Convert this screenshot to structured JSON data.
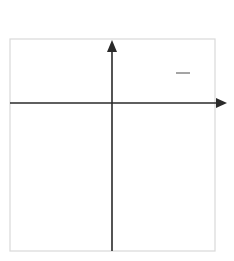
{
  "chart_data": {
    "type": "line",
    "title": "",
    "function": "f(x) = -1/3 x^2",
    "xlabel": "x",
    "ylabel": "y",
    "xlim": [
      -5,
      5
    ],
    "ylim": [
      -7,
      3
    ],
    "grid": true,
    "grid_step": 1,
    "series": [
      {
        "name": "f(x) = -1/3 x^2",
        "x": [
          -4.5,
          -4,
          -3,
          -2,
          -1,
          0,
          1,
          2,
          3,
          4,
          4.5
        ],
        "y": [
          -6.75,
          -5.33,
          -3,
          -1.33,
          -0.33,
          0,
          -0.33,
          -1.33,
          -3,
          -5.33,
          -6.75
        ]
      }
    ],
    "annotations": [
      {
        "text": "f(x) = -1/3 x^2",
        "position": "upper right of y-axis"
      }
    ],
    "colors": {
      "curve": "#4a4a4a",
      "axis": "#2a2a2a",
      "grid": "#d9d9d9"
    }
  },
  "labels": {
    "x_axis": "x",
    "y_axis": "y",
    "eq_lhs": "f(x) = −",
    "eq_num": "1",
    "eq_den": "3",
    "eq_var": "x",
    "eq_exp": "2"
  }
}
